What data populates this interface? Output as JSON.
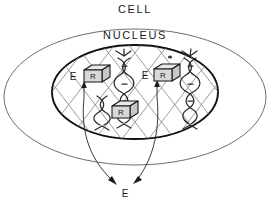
{
  "diagram": {
    "background_color": "#ffffff",
    "ink_color": "#1a1a1a",
    "membrane_color": "#6e6e6e",
    "envelope_color": "#111111",
    "grid_color": "#8a8a8a",
    "labels": {
      "cell": "CELL",
      "nucleus": "NUCLEUS",
      "enzyme_left": "E",
      "enzyme_right": "E",
      "receptor_left": "R",
      "receptor_right": "R",
      "receptor_center": "R",
      "callout_bottom": "E"
    },
    "structures": {
      "cell_membrane": "cell-membrane-ellipse",
      "nuclear_envelope": "nuclear-envelope-ellipse",
      "chromatin_lattice": "diagonal-crosshatch-grid",
      "nucleolus": "nucleolus-dot",
      "dna_helices": [
        "dna-helix-left",
        "dna-helix-right",
        "dna-helix-lower-left"
      ],
      "receptor_cubes": [
        "receptor-cube-left",
        "receptor-cube-right",
        "receptor-cube-center"
      ],
      "arrows": [
        "arrow-to-receptor-left",
        "arrow-to-receptor-right",
        "callout-leader-left",
        "callout-leader-right"
      ]
    }
  }
}
